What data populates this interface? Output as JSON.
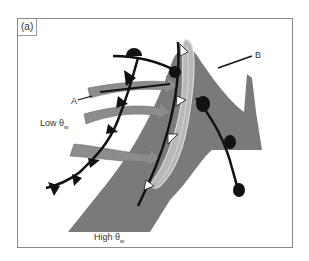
{
  "figure": {
    "panel_label": "(a)",
    "labels": {
      "point_a": "A",
      "point_b": "B",
      "low_theta": "Low θ",
      "low_theta_sub": "w",
      "high_theta": "High θ",
      "high_theta_sub": "w"
    },
    "colors": {
      "frame": "#8a8a8a",
      "warm_conveyor": "#7a7a7a",
      "dry_intrusion_arrows": "#8c8c8c",
      "moist_band": "#b8b8b8",
      "front_lines": "#111111",
      "background": "#ffffff"
    }
  }
}
